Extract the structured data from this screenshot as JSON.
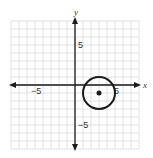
{
  "chart_data": {
    "type": "scatter",
    "title": "",
    "xlabel": "x",
    "ylabel": "y",
    "xlim": [
      -8,
      8
    ],
    "ylim": [
      -8,
      8
    ],
    "grid": true,
    "grid_step": 1,
    "tick_labels": {
      "x": [
        {
          "value": -5,
          "label": "−5"
        },
        {
          "value": 5,
          "label": "5"
        }
      ],
      "y": [
        {
          "value": 5,
          "label": "5"
        },
        {
          "value": -5,
          "label": "−5"
        }
      ]
    },
    "shapes": [
      {
        "kind": "circle",
        "center": [
          3,
          -1
        ],
        "radius": 2,
        "stroke": "#1a1a1a"
      }
    ],
    "points": [
      {
        "x": 3,
        "y": -1,
        "label": "center"
      }
    ]
  },
  "labels": {
    "x_axis": "x",
    "y_axis": "y",
    "x_neg5": "−5",
    "x_pos5": "5",
    "y_pos5": "5",
    "y_neg5": "−5"
  },
  "colors": {
    "grid": "#d9d9d9",
    "axis": "#1a1a1a",
    "circle": "#1a1a1a"
  }
}
